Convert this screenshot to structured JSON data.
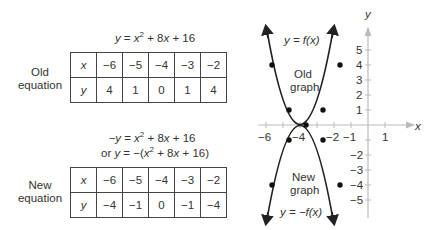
{
  "old": {
    "equation": {
      "lhs": "y",
      "eq": " = ",
      "x": "x",
      "sup": "2",
      "rest1": " + 8",
      "x2": "x",
      "rest2": " + 16"
    },
    "label_line1": "Old",
    "label_line2": "equation",
    "x_header": "x",
    "y_header": "y",
    "x_values": [
      "−6",
      "−5",
      "−4",
      "−3",
      "−2"
    ],
    "y_values": [
      "4",
      "1",
      "0",
      "1",
      "4"
    ]
  },
  "new": {
    "equation_line1": {
      "lhs": "−y",
      "eq": " = ",
      "x": "x",
      "sup": "2",
      "rest1": " + 8",
      "x2": "x",
      "rest2": " + 16"
    },
    "equation_line2": {
      "or": "or ",
      "lhs": "y",
      "eq": " = −(",
      "x": "x",
      "sup": "2",
      "rest1": " + 8",
      "x2": "x",
      "rest2": " + 16)"
    },
    "label_line1": "New",
    "label_line2": "equation",
    "x_header": "x",
    "y_header": "y",
    "x_values": [
      "−6",
      "−5",
      "−4",
      "−3",
      "−2"
    ],
    "y_values": [
      "−4",
      "−1",
      "0",
      "−1",
      "−4"
    ]
  },
  "graph": {
    "x_axis_label": "x",
    "y_axis_label": "y",
    "x_tick_labels": [
      "−6",
      "−4",
      "−2",
      "−1",
      "1"
    ],
    "y_tick_labels_pos": [
      "5",
      "4",
      "3",
      "2",
      "1"
    ],
    "y_tick_labels_neg": [
      "−2",
      "−3",
      "−4",
      "−5"
    ],
    "old_curve_label": "y = f(x)",
    "old_graph_line1": "Old",
    "old_graph_line2": "graph",
    "new_curve_label": "y = −f(x)",
    "new_graph_line1": "New",
    "new_graph_line2": "graph",
    "old_points": [
      [
        -6,
        4
      ],
      [
        -5,
        1
      ],
      [
        -4,
        0
      ],
      [
        -3,
        1
      ],
      [
        -2,
        4
      ]
    ],
    "new_points": [
      [
        -6,
        -4
      ],
      [
        -5,
        -1
      ],
      [
        -4,
        0
      ],
      [
        -3,
        -1
      ],
      [
        -2,
        -4
      ]
    ],
    "colors": {
      "curve": "#222222",
      "axis": "#bbbbbb",
      "text": "#333333"
    }
  }
}
